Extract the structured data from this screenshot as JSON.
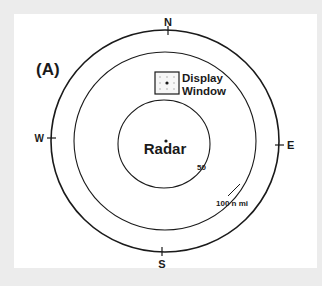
{
  "figure": {
    "panel_label": "(A)",
    "compass": {
      "north": "N",
      "south": "S",
      "east": "E",
      "west": "W"
    },
    "center_label": "Radar",
    "inset": {
      "line1": "Display",
      "line2": "Window"
    },
    "range_labels": {
      "inner": "50",
      "outer": "100 n mi"
    },
    "colors": {
      "background": "#ececec",
      "panel": "#ffffff",
      "ink": "#1a1a1a"
    }
  }
}
